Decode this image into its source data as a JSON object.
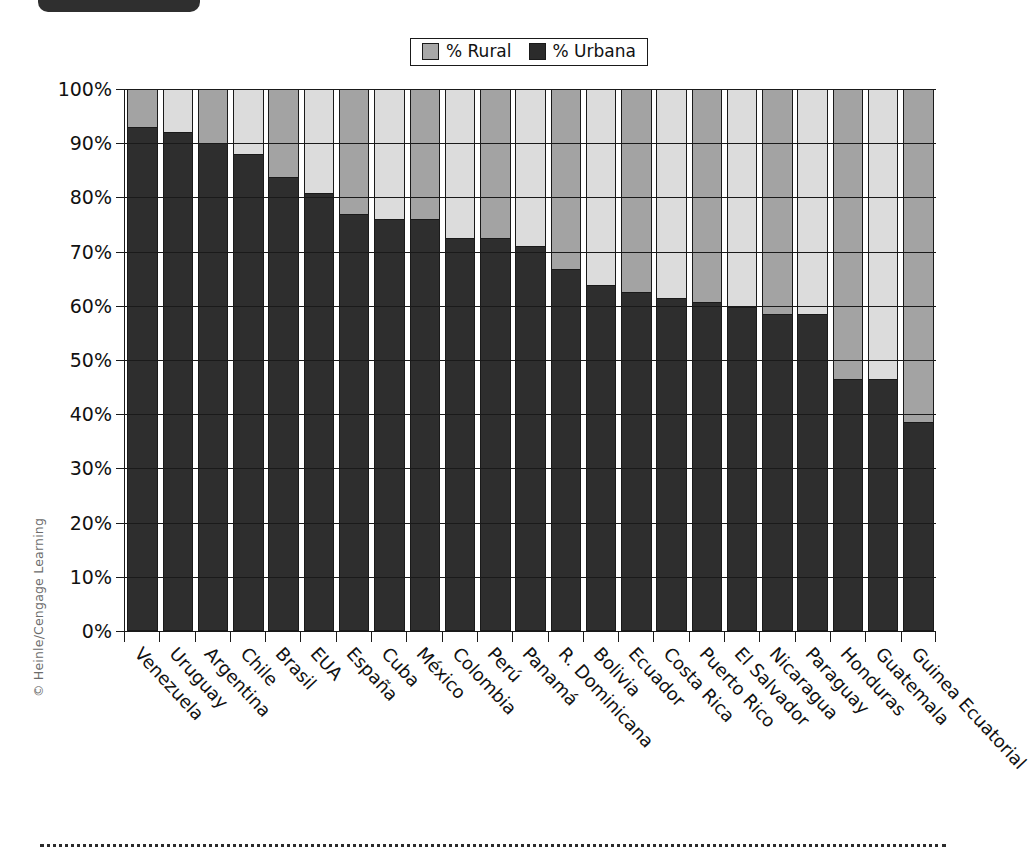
{
  "watermark": "© Heinle/Cengage Learning",
  "legend": {
    "items": [
      {
        "label": "% Rural",
        "swatch": "rural",
        "color": "#a8a8a8"
      },
      {
        "label": "% Urbana",
        "swatch": "urbana",
        "color": "#2b2b2b"
      }
    ]
  },
  "chart_data": {
    "type": "bar",
    "stacked": true,
    "title": "",
    "subtitle": "",
    "xlabel": "",
    "ylabel": "",
    "ylim": [
      0,
      100
    ],
    "yticks": [
      "0%",
      "10%",
      "20%",
      "30%",
      "40%",
      "50%",
      "60%",
      "70%",
      "80%",
      "90%",
      "100%"
    ],
    "ytick_values": [
      0,
      10,
      20,
      30,
      40,
      50,
      60,
      70,
      80,
      90,
      100
    ],
    "grid": true,
    "legend_position": "top-center",
    "categories": [
      "Venezuela",
      "Uruguay",
      "Argentina",
      "Chile",
      "Brasil",
      "EUA",
      "España",
      "Cuba",
      "México",
      "Colombia",
      "Perú",
      "Panamá",
      "R. Dominicana",
      "Bolivia",
      "Ecuador",
      "Costa Rica",
      "Puerto Rico",
      "El Salvador",
      "Nicaragua",
      "Paraguay",
      "Honduras",
      "Guatemala",
      "Guinea Ecuatorial"
    ],
    "series": [
      {
        "name": "% Urbana",
        "color": "#2e2e2e",
        "values": [
          93,
          92,
          90,
          88,
          83.8,
          80.8,
          77,
          76,
          76,
          72.6,
          72.6,
          71,
          66.8,
          63.8,
          62.5,
          61.5,
          60.7,
          59.7,
          58.5,
          58.5,
          46.5,
          46.5,
          38.5
        ]
      },
      {
        "name": "% Rural",
        "color": "#a8a8a8",
        "values": [
          7,
          8,
          10,
          12,
          16.2,
          19.2,
          23,
          24,
          24,
          27.4,
          27.4,
          29,
          33.2,
          36.2,
          37.5,
          38.5,
          39.3,
          40.3,
          41.5,
          41.5,
          53.5,
          53.5,
          61.5
        ]
      }
    ]
  }
}
